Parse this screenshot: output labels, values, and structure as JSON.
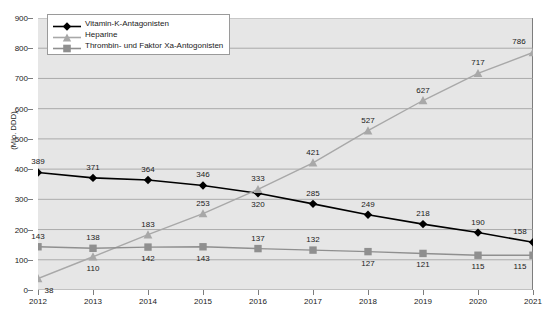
{
  "chart_data": {
    "type": "line",
    "title": "",
    "subtitle": "",
    "xlabel": "",
    "ylabel": "(Mio. DDD)",
    "categories": [
      "2012",
      "2013",
      "2014",
      "2015",
      "2016",
      "2017",
      "2018",
      "2019",
      "2020",
      "2021"
    ],
    "ylim": [
      0,
      900
    ],
    "y_ticks": [
      0,
      100,
      200,
      300,
      400,
      500,
      600,
      700,
      800,
      900
    ],
    "grid": true,
    "legend_position": "top-left",
    "series": [
      {
        "name": "Vitamin-K-Antagonisten",
        "marker": "diamond",
        "color": "#000000",
        "values": [
          389,
          371,
          364,
          346,
          320,
          285,
          249,
          218,
          190,
          158
        ]
      },
      {
        "name": "Heparine",
        "marker": "triangle",
        "color": "#a8a8a8",
        "values": [
          38,
          110,
          183,
          253,
          333,
          421,
          527,
          627,
          717,
          786
        ]
      },
      {
        "name": "Thrombin- und Faktor Xa-Antogonisten",
        "marker": "square",
        "color": "#8f8f8f",
        "values": [
          143,
          138,
          142,
          143,
          137,
          132,
          127,
          121,
          115,
          115
        ]
      }
    ]
  },
  "legend": {
    "items": [
      {
        "label": "Vitamin-K-Antagonisten",
        "icon": "diamond-marker-icon"
      },
      {
        "label": "Heparine",
        "icon": "triangle-marker-icon"
      },
      {
        "label": "Thrombin- und Faktor Xa-Antogonisten",
        "icon": "square-marker-icon"
      }
    ]
  },
  "colors": {
    "plot_background": "#e6e6e6",
    "gridline": "#9c9c9c",
    "axis": "#7d7d7d",
    "text": "#1a1a1a",
    "series_vitamin_k": "#000000",
    "series_heparine": "#a8a8a8",
    "series_thrombin": "#8f8f8f"
  }
}
